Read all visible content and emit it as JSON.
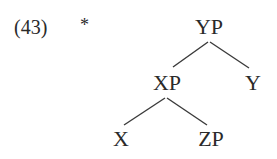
{
  "example": {
    "number": "(43)",
    "judgment": "*"
  },
  "tree": {
    "nodes": {
      "root": {
        "label": "YP"
      },
      "left": {
        "label": "XP"
      },
      "right": {
        "label": "Y"
      },
      "left_left": {
        "label": "X"
      },
      "left_right": {
        "label": "ZP"
      }
    },
    "edges": [
      [
        "YP",
        "XP"
      ],
      [
        "YP",
        "Y"
      ],
      [
        "XP",
        "X"
      ],
      [
        "XP",
        "ZP"
      ]
    ]
  },
  "colors": {
    "text": "#2a2a2a",
    "line": "#3a3a3a",
    "background": "#ffffff"
  }
}
